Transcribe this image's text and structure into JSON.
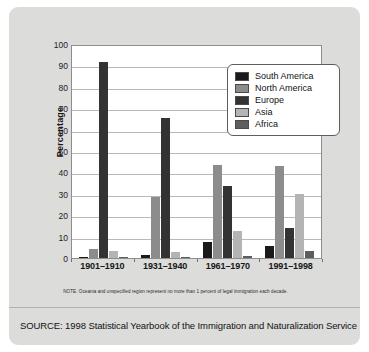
{
  "chart_data": {
    "type": "bar",
    "title": "",
    "xlabel": "",
    "ylabel": "Percentage",
    "ylim": [
      0,
      100
    ],
    "ytick_step": 10,
    "yticks": [
      100,
      90,
      80,
      70,
      60,
      50,
      40,
      30,
      20,
      10,
      0
    ],
    "grid": true,
    "legend_position": "top-right inside plot",
    "categories": [
      "1901–1910",
      "1931–1940",
      "1961–1970",
      "1991–1998"
    ],
    "series": [
      {
        "name": "South America",
        "color": "#1a1a1a",
        "values": [
          0.5,
          1.5,
          7.5,
          5.5
        ]
      },
      {
        "name": "North America",
        "color": "#8c8c8c",
        "values": [
          4.0,
          28.5,
          43.5,
          43.0
        ]
      },
      {
        "name": "Europe",
        "color": "#333333",
        "values": [
          91.6,
          65.5,
          33.5,
          14.0
        ]
      },
      {
        "name": "Asia",
        "color": "#b4b4b4",
        "values": [
          3.5,
          3.0,
          12.5,
          30.0
        ]
      },
      {
        "name": "Africa",
        "color": "#5e5e5e",
        "values": [
          0.3,
          0.5,
          1.0,
          3.5
        ]
      }
    ],
    "note": "NOTE: Oceania and unspecified region represent no more than 1 percent of legal immigration each decade.",
    "source": "SOURCE: 1998 Statistical Yearbook of the Immigration and Naturalization Service"
  },
  "figure": {
    "background_color": "#dcdcda",
    "plot_background_color": "#ffffff",
    "axis_color": "#8d8d8d",
    "gridline_color": "#b9b9b9"
  }
}
